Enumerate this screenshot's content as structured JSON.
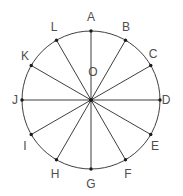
{
  "figure": {
    "name": "circle-with-twelve-radii",
    "type": "geometry-diagram",
    "width": 183,
    "height": 196,
    "background_color": "#ffffff",
    "stroke_color": "#3f3f3f",
    "label_color": "#4d4d4d",
    "marker_color": "#1a1a1a",
    "stroke_width": 1,
    "marker_radius": 1.7,
    "circle": {
      "center_x": 91,
      "center_y": 100,
      "radius": 69,
      "center_label": "O",
      "center_label_x": 93,
      "center_label_y": 72
    },
    "points": [
      {
        "label": "A",
        "angle_deg": 90,
        "label_x": 91,
        "label_y": 17
      },
      {
        "label": "B",
        "angle_deg": 60,
        "label_x": 126,
        "label_y": 27
      },
      {
        "label": "C",
        "angle_deg": 30,
        "label_x": 153,
        "label_y": 54
      },
      {
        "label": "D",
        "angle_deg": 0,
        "label_x": 166,
        "label_y": 100
      },
      {
        "label": "E",
        "angle_deg": 330,
        "label_x": 155,
        "label_y": 146
      },
      {
        "label": "F",
        "angle_deg": 300,
        "label_x": 128,
        "label_y": 174
      },
      {
        "label": "G",
        "angle_deg": 270,
        "label_x": 91,
        "label_y": 184
      },
      {
        "label": "H",
        "angle_deg": 240,
        "label_x": 55,
        "label_y": 174
      },
      {
        "label": "I",
        "angle_deg": 210,
        "label_x": 25,
        "label_y": 146
      },
      {
        "label": "J",
        "angle_deg": 180,
        "label_x": 15,
        "label_y": 100
      },
      {
        "label": "K",
        "angle_deg": 150,
        "label_x": 25,
        "label_y": 56
      },
      {
        "label": "L",
        "angle_deg": 120,
        "label_x": 54,
        "label_y": 27
      }
    ]
  },
  "chart_data": {
    "type": "scatter",
    "title": "",
    "xlabel": "",
    "ylabel": "",
    "point_count": 12,
    "angular_spacing_deg": 30,
    "categories": [
      "A",
      "B",
      "C",
      "D",
      "E",
      "F",
      "G",
      "H",
      "I",
      "J",
      "K",
      "L"
    ],
    "values": [
      90,
      60,
      30,
      0,
      330,
      300,
      270,
      240,
      210,
      180,
      150,
      120
    ],
    "grid": false,
    "legend_position": "none"
  }
}
